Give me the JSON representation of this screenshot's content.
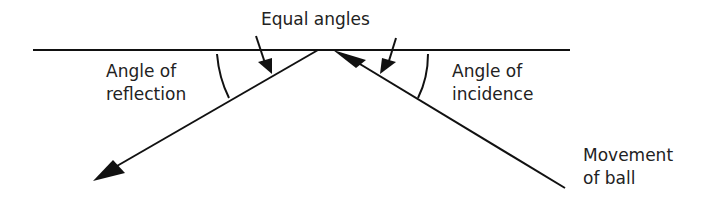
{
  "diagram": {
    "title_label": "Equal angles",
    "left_label_line1": "Angle of",
    "left_label_line2": "reflection",
    "right_label_line1": "Angle of",
    "right_label_line2": "incidence",
    "ball_label_line1": "Movement",
    "ball_label_line2": "of ball",
    "stroke_color": "#111111"
  }
}
